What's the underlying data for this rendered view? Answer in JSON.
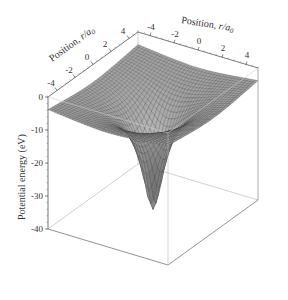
{
  "chart_data": {
    "type": "surface3d",
    "title": "",
    "x_axis": {
      "label": "Position, r/a0",
      "label_italic_part": "r/a",
      "label_sub": "0",
      "ticks": [
        "-4",
        "-2",
        "0",
        "2",
        "4"
      ],
      "range": [
        -5,
        5
      ]
    },
    "y_axis": {
      "label": "Position, r/a0",
      "label_italic_part": "r/a",
      "label_sub": "0",
      "ticks": [
        "-4",
        "-2",
        "0",
        "2",
        "4"
      ],
      "range": [
        -5,
        5
      ]
    },
    "z_axis": {
      "label": "Potential energy (eV)",
      "ticks": [
        "0",
        "-10",
        "-20",
        "-30",
        "-40"
      ],
      "range": [
        -40,
        0
      ]
    },
    "surface": {
      "function": "V(r) = -27.2 / sqrt(r^2 + 0.3) eV (softened Coulomb, approximately)",
      "edge_value": -5,
      "min_value": -40,
      "grid_lines": 40,
      "color": "#9a9a9a",
      "mesh_color": "#3a3a3a"
    },
    "grid": false,
    "legend": null
  },
  "labels": {
    "x_axis_label": "Position, ",
    "x_axis_label_italic": "r/a",
    "x_axis_label_sub": "0",
    "y_axis_label": "Position, ",
    "y_axis_label_italic": "r/a",
    "y_axis_label_sub": "0",
    "z_axis_label": "Potential energy (eV)"
  },
  "ticks": {
    "left_axis": [
      "-4",
      "-2",
      "0",
      "2",
      "4"
    ],
    "right_axis": [
      "-4",
      "-2",
      "0",
      "2",
      "4"
    ],
    "z_axis": [
      "0",
      "-10",
      "-20",
      "-30",
      "-40"
    ]
  }
}
